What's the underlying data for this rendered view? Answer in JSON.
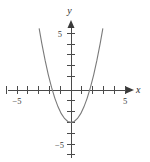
{
  "figure": {
    "background_color": "#ffffff",
    "axis_color": "#4a4a4a",
    "curve_color": "#7a7a7a"
  },
  "axes": {
    "x_axis_label": "x",
    "y_axis_label": "y",
    "x_tick_labels": [
      {
        "value": -5,
        "text": "−5"
      },
      {
        "value": 5,
        "text": "5"
      }
    ],
    "y_tick_labels": [
      {
        "value": 5,
        "text": "5"
      },
      {
        "value": -5,
        "text": "−5"
      }
    ],
    "x_ticks": [
      -6,
      -5,
      -4,
      -3,
      -2,
      -1,
      1,
      2,
      3,
      4,
      5,
      6
    ],
    "y_ticks": [
      -5,
      -4,
      -3,
      -2,
      -1,
      1,
      2,
      3,
      4,
      5,
      6
    ],
    "origin_px": {
      "x": 71,
      "y": 90
    },
    "unit_px": 10.8,
    "xlim": [
      -6.4,
      6.8
    ],
    "ylim": [
      -6.4,
      6.6
    ]
  },
  "chart_data": {
    "type": "line",
    "title": "",
    "xlabel": "x",
    "ylabel": "y",
    "xlim": [
      -6.4,
      6.8
    ],
    "ylim": [
      -6.4,
      6.6
    ],
    "grid": false,
    "legend": "none",
    "series": [
      {
        "name": "parabola",
        "equation": "y = x^2 - 3",
        "vertex": [
          0,
          -3
        ],
        "x_intercepts": [
          -1.73,
          1.73
        ],
        "y_intercept": -3,
        "opens": "up",
        "x": [
          -2.95,
          -2.7,
          -2.4,
          -2.1,
          -1.8,
          -1.5,
          -1.2,
          -0.9,
          -0.6,
          -0.3,
          0,
          0.3,
          0.6,
          0.9,
          1.2,
          1.5,
          1.8,
          2.1,
          2.4,
          2.7,
          2.95
        ],
        "y": [
          5.7,
          4.29,
          2.76,
          1.41,
          0.24,
          -0.75,
          -1.56,
          -2.19,
          -2.64,
          -2.91,
          -3,
          -2.91,
          -2.64,
          -2.19,
          -1.56,
          -0.75,
          0.24,
          1.41,
          2.76,
          4.29,
          5.7
        ]
      }
    ]
  }
}
